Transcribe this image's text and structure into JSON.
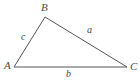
{
  "figure": {
    "kind": "geometry-diagram",
    "shape": "triangle",
    "background_color": "#ffffff",
    "stroke_color": "#555555",
    "stroke_width": 1,
    "label_color": "#4a4a4a",
    "width": 140,
    "height": 82,
    "vertices": [
      {
        "id": "A",
        "label": "A",
        "x": 14,
        "y": 67,
        "label_x": 4,
        "label_y": 60
      },
      {
        "id": "B",
        "label": "B",
        "x": 45,
        "y": 17,
        "label_x": 41,
        "label_y": 2
      },
      {
        "id": "C",
        "label": "C",
        "x": 127,
        "y": 67,
        "label_x": 130,
        "label_y": 61
      }
    ],
    "sides": [
      {
        "id": "a",
        "label": "a",
        "from": "B",
        "to": "C",
        "label_x": 87,
        "label_y": 25
      },
      {
        "id": "b",
        "label": "b",
        "from": "A",
        "to": "C",
        "label_x": 66,
        "label_y": 69
      },
      {
        "id": "c",
        "label": "c",
        "from": "A",
        "to": "B",
        "label_x": 21,
        "label_y": 32
      }
    ],
    "path": "M 14 67 L 45 17 L 127 67 Z"
  }
}
